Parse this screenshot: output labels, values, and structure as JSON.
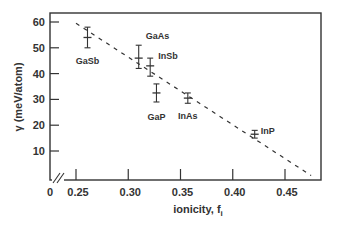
{
  "chart_data": {
    "type": "scatter",
    "title": "",
    "xlabel": "ionicity, f_i",
    "xlabel_main": "ionicity, f",
    "xlabel_sub": "i",
    "ylabel": "γ (meV/atom)",
    "xlim": [
      0.24,
      0.48
    ],
    "ylim": [
      0,
      63
    ],
    "x_axis_break": true,
    "x_origin_label": "0",
    "x_ticks": [
      0.25,
      0.3,
      0.35,
      0.4,
      0.45
    ],
    "x_tick_labels": [
      "0.25",
      "0.30",
      "0.35",
      "0.40",
      "0.45"
    ],
    "y_ticks": [
      10,
      20,
      30,
      40,
      50,
      60
    ],
    "y_tick_labels": [
      "10",
      "20",
      "30",
      "40",
      "50",
      "60"
    ],
    "grid": false,
    "legend": null,
    "points": [
      {
        "label": "GaSb",
        "x": 0.261,
        "y": 54,
        "y_err_low": 50,
        "y_err_high": 58
      },
      {
        "label": "GaAs",
        "x": 0.31,
        "y": 46,
        "y_err_low": 42,
        "y_err_high": 51
      },
      {
        "label": "InSb",
        "x": 0.321,
        "y": 43,
        "y_err_low": 39,
        "y_err_high": 46
      },
      {
        "label": "GaP",
        "x": 0.327,
        "y": 32.5,
        "y_err_low": 29,
        "y_err_high": 36
      },
      {
        "label": "InAs",
        "x": 0.357,
        "y": 30.5,
        "y_err_low": 28.5,
        "y_err_high": 32.5
      },
      {
        "label": "InP",
        "x": 0.421,
        "y": 16.5,
        "y_err_low": 15,
        "y_err_high": 18
      }
    ],
    "fit_line": {
      "style": "dashed",
      "x": [
        0.25,
        0.475
      ],
      "y": [
        59.5,
        0.5
      ]
    }
  }
}
